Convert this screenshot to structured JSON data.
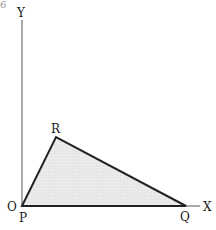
{
  "diagram": {
    "corner_fragment": "6",
    "axes": {
      "x_label": "X",
      "y_label": "Y",
      "origin_label": "O"
    },
    "triangle": {
      "vertices": [
        {
          "name": "P",
          "x": 22,
          "y": 206
        },
        {
          "name": "Q",
          "x": 186,
          "y": 206
        },
        {
          "name": "R",
          "x": 56,
          "y": 137
        }
      ],
      "labels": {
        "p": "P",
        "q": "Q",
        "r": "R"
      },
      "fill": "#e6e6e6",
      "stroke": "#222222"
    }
  }
}
